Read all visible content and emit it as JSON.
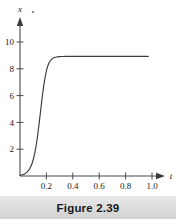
{
  "figure": {
    "caption": "Figure 2.39",
    "background_color": "#ffffff",
    "caption_bar_color": "#dedede",
    "curve_color": "#3a3a3a",
    "axis_color": "#4a4a4a"
  },
  "axes": {
    "x_axis_label": "t",
    "y_axis_label": "x",
    "x_ticks": [
      "0.2",
      "0.4",
      "0.6",
      "0.8",
      "1.0"
    ],
    "y_ticks": [
      "2",
      "4",
      "6",
      "8",
      "10"
    ]
  },
  "chart_data": {
    "type": "line",
    "title": "Figure 2.39",
    "xlabel": "t",
    "ylabel": "x",
    "xlim": [
      0,
      1.08
    ],
    "ylim": [
      0,
      11.2
    ],
    "xticks": [
      0.2,
      0.4,
      0.6,
      0.8,
      1.0
    ],
    "xticklabels": [
      "0.2",
      "0.4",
      "0.6",
      "0.8",
      "1.0"
    ],
    "yticks": [
      2,
      4,
      6,
      8,
      10
    ],
    "yticklabels": [
      "2",
      "4",
      "6",
      "8",
      "10"
    ],
    "grid": false,
    "legend": null,
    "annotations": [],
    "series": [
      {
        "name": "logistic growth x(t)",
        "description": "Sigmoid curve rising from 0 toward carrying capacity 10, inflection near t=0.175",
        "x": [
          0.0,
          0.02,
          0.04,
          0.06,
          0.08,
          0.1,
          0.12,
          0.14,
          0.16,
          0.18,
          0.2,
          0.22,
          0.24,
          0.26,
          0.28,
          0.3,
          0.32,
          0.34,
          0.36,
          0.38,
          0.4,
          0.45,
          0.5,
          0.55,
          0.6,
          0.65,
          0.7,
          0.75,
          0.8,
          0.85,
          0.9,
          0.95,
          1.0,
          1.05
        ],
        "y": [
          0.06,
          0.11,
          0.19,
          0.35,
          0.62,
          1.09,
          1.87,
          3.07,
          4.69,
          6.45,
          7.93,
          8.95,
          9.5,
          9.77,
          9.89,
          9.95,
          9.98,
          9.99,
          9.99,
          10.0,
          10.0,
          10.0,
          10.0,
          10.0,
          10.0,
          10.0,
          10.0,
          10.0,
          10.0,
          10.0,
          10.0,
          10.0,
          10.0,
          10.0
        ]
      }
    ]
  }
}
